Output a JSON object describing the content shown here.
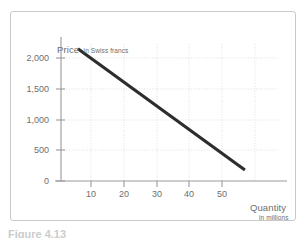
{
  "figure": {
    "caption": "Figure 4.13"
  },
  "axes": {
    "y_title_main": "Price",
    "y_title_sub": "in Swiss francs",
    "x_title_main": "Quantity",
    "x_title_sub": "in millions"
  },
  "colors": {
    "line": "#2d2d2d",
    "axis": "#8a8a8a",
    "grid": "#d6d6d6",
    "text": "#6d6e70",
    "frame": "#c9c9c9"
  },
  "chart_data": {
    "type": "line",
    "title": "",
    "xlabel": "Quantity in millions",
    "ylabel": "Price in Swiss francs",
    "xlim": [
      0,
      60
    ],
    "ylim": [
      0,
      2300
    ],
    "xticks": [
      10,
      20,
      30,
      40,
      50
    ],
    "yticks": [
      0,
      500,
      1000,
      1500,
      2000
    ],
    "xtick_labels": [
      "10",
      "20",
      "30",
      "40",
      "50"
    ],
    "ytick_labels": [
      "0",
      "500",
      "1,000",
      "1,500",
      "2,000"
    ],
    "grid": true,
    "legend": false,
    "series": [
      {
        "name": "Demand curve",
        "x": [
          6,
          57
        ],
        "y": [
          2150,
          180
        ]
      }
    ]
  }
}
